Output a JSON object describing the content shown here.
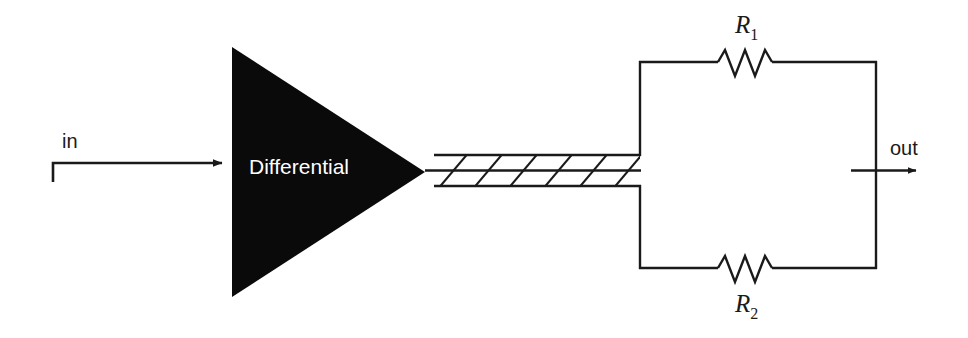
{
  "figure": {
    "kind": "circuit-block-diagram",
    "background_color": "#ffffff",
    "line_color": "#1a1a1a",
    "block_fill_color": "#000000",
    "block_text_color": "#ffffff"
  },
  "input": {
    "label": "in",
    "arrow_name": "input-signal-arrow"
  },
  "amplifier": {
    "label": "Differential",
    "shape": "triangle-right-pointing"
  },
  "bus": {
    "name": "hatched-signal-bus",
    "hatch_count": 6,
    "description": "hatched wide bus"
  },
  "network": {
    "resistors": [
      {
        "label_base": "R",
        "label_sub": "1",
        "position": "top",
        "name": "resistor-r1"
      },
      {
        "label_base": "R",
        "label_sub": "2",
        "position": "bottom",
        "name": "resistor-r2"
      }
    ]
  },
  "output": {
    "label": "out",
    "arrow_name": "output-signal-arrow"
  }
}
